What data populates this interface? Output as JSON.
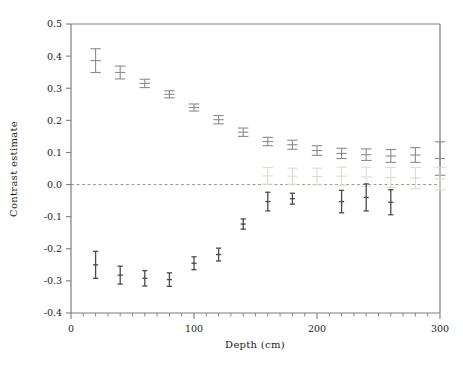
{
  "chart_data": {
    "type": "scatter",
    "title": "",
    "xlabel": "Depth (cm)",
    "ylabel": "Contrast estimate",
    "xlim": [
      0,
      300
    ],
    "ylim": [
      -0.4,
      0.5
    ],
    "xticks": [
      0,
      100,
      200,
      300
    ],
    "xtick_labels": [
      "0",
      "100",
      "200",
      "300"
    ],
    "xminor_step": 10,
    "yticks": [
      -0.4,
      -0.3,
      -0.2,
      -0.1,
      0.0,
      0.1,
      0.2,
      0.3,
      0.4,
      0.5
    ],
    "ytick_labels": [
      "-0.4",
      "-0.3",
      "-0.2",
      "-0.1",
      "0.0",
      "0.1",
      "0.2",
      "0.3",
      "0.4",
      "0.5"
    ],
    "grid": false,
    "legend": "none",
    "zero_line": {
      "value": 0.0,
      "style": "dashed",
      "color": "#9a9a9a"
    },
    "error_bar_style": "cap-and-whisker",
    "series": [
      {
        "name": "upper-series",
        "color": "#8c8c8c",
        "x": [
          20,
          40,
          60,
          80,
          100,
          120,
          140,
          160,
          180,
          200,
          220,
          240,
          260,
          280,
          300
        ],
        "y": [
          0.386,
          0.349,
          0.315,
          0.281,
          0.24,
          0.202,
          0.163,
          0.134,
          0.124,
          0.106,
          0.097,
          0.093,
          0.089,
          0.092,
          0.081
        ],
        "yerr": [
          0.037,
          0.02,
          0.013,
          0.011,
          0.011,
          0.013,
          0.013,
          0.013,
          0.014,
          0.015,
          0.016,
          0.018,
          0.02,
          0.023,
          0.052
        ]
      },
      {
        "name": "middle-series",
        "color": "#dcdcd2",
        "x": [
          160,
          180,
          200,
          220,
          240,
          260,
          280,
          300
        ],
        "y": [
          0.027,
          0.026,
          0.025,
          0.026,
          0.024,
          0.022,
          0.02,
          0.018
        ],
        "yerr": [
          0.026,
          0.025,
          0.026,
          0.028,
          0.03,
          0.031,
          0.033,
          0.035
        ]
      },
      {
        "name": "lower-series",
        "color": "#4a4a4a",
        "x": [
          20,
          40,
          60,
          80,
          100,
          120,
          140,
          160,
          180,
          220,
          240,
          260
        ],
        "y": [
          -0.25,
          -0.282,
          -0.292,
          -0.296,
          -0.245,
          -0.218,
          -0.123,
          -0.053,
          -0.044,
          -0.053,
          -0.04,
          -0.055
        ],
        "yerr": [
          0.042,
          0.028,
          0.024,
          0.021,
          0.02,
          0.02,
          0.016,
          0.029,
          0.017,
          0.035,
          0.042,
          0.039
        ]
      }
    ]
  },
  "axes": {
    "x_label": "Depth (cm)",
    "y_label": "Contrast estimate"
  }
}
